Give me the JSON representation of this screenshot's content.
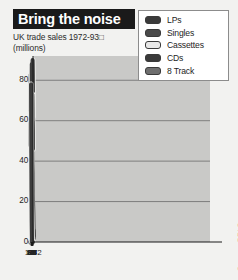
{
  "title": "Bring the noise",
  "subtitle_line1": "UK trade sales 1972-93□",
  "subtitle_line2": "(millions)",
  "source": "Source: BPI Surveys",
  "legend": {
    "items": [
      {
        "label": "LPs",
        "swatch_color": "#3a3a3a"
      },
      {
        "label": "Singles",
        "swatch_color": "#4a4a4a"
      },
      {
        "label": "Cassettes",
        "swatch_color": "#e8e8e8"
      },
      {
        "label": "CDs",
        "swatch_color": "#3a3a3a"
      },
      {
        "label": "8 Track",
        "swatch_color": "#6e6e6e"
      }
    ]
  },
  "colors": {
    "title_bar": "#1a1a1a",
    "title_text": "#ffffff",
    "page_bg": "#f2f2f0",
    "plot_bg": "#c9c9c7",
    "gridline": "#6b6b6b",
    "axis": "#1a1a1a",
    "dark_series": "#3c3c3c",
    "light_series": "#f0f0ee",
    "light_series_edge": "#2e2e2e"
  },
  "chart_data": {
    "type": "line",
    "title": "Bring the noise",
    "subtitle": "UK trade sales 1972-93 (millions)",
    "xlabel": "",
    "ylabel": "millions",
    "xlim": [
      1972,
      93
    ],
    "ylim": [
      0,
      92
    ],
    "yticks": [
      0,
      20,
      40,
      60,
      80
    ],
    "ytick_labels": [
      "0",
      "20",
      "40",
      "60",
      "80"
    ],
    "xticks": [
      1972,
      1974,
      1976,
      1978,
      1980,
      1982,
      1984,
      1986,
      1988,
      1990,
      1992
    ],
    "xtick_labels": [
      "1972",
      "74",
      "76",
      "78",
      "80",
      "82",
      "84",
      "86",
      "88",
      "90",
      "92"
    ],
    "grid": true,
    "legend_position": "top-right",
    "x": [
      1972,
      1973,
      1974,
      1975,
      1976,
      1977,
      1978,
      1979,
      1980,
      1981,
      1982,
      1983,
      1984,
      1985,
      1986,
      1987,
      1988,
      1989,
      1990,
      1991,
      1992,
      1993
    ],
    "series": [
      {
        "name": "LPs",
        "style": "dark",
        "values": [
          62,
          77,
          84,
          88,
          90,
          87,
          85,
          74,
          78,
          80,
          74,
          79,
          85,
          88,
          73,
          66,
          62,
          63,
          61,
          60,
          62,
          64
        ]
      },
      {
        "name": "Singles",
        "style": "dark",
        "values": [
          46,
          54,
          58,
          60,
          58,
          67,
          72,
          73,
          71,
          72,
          70,
          65,
          60,
          54,
          49,
          44,
          39,
          38,
          36,
          34,
          32,
          33
        ]
      },
      {
        "name": "Cassettes",
        "style": "light",
        "values": [
          2,
          5,
          9,
          13,
          16,
          18,
          20,
          21,
          23,
          27,
          32,
          37,
          46,
          55,
          62,
          71,
          78,
          83,
          81,
          74,
          60,
          48
        ]
      },
      {
        "name": "CDs",
        "style": "dark",
        "values": [
          0,
          0,
          0,
          0,
          0,
          0,
          0,
          0,
          0,
          0,
          0,
          1,
          3,
          6,
          10,
          17,
          25,
          34,
          44,
          55,
          66,
          78
        ]
      },
      {
        "name": "8 Track",
        "style": "light",
        "values": [
          3,
          5,
          6,
          6,
          5,
          4,
          3,
          2,
          1,
          0,
          0,
          0,
          0,
          0,
          0,
          0,
          0,
          0,
          0,
          0,
          0,
          0
        ]
      }
    ]
  }
}
